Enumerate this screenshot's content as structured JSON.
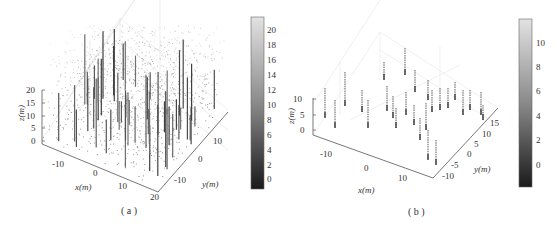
{
  "chart_data": [
    {
      "type": "scatter3d",
      "panel": "a",
      "caption": "( a )",
      "description": "3D point cloud of forest stand (dense canopy points + trunks), grayscale by height",
      "xlabel": "x(m)",
      "ylabel": "y(m)",
      "zlabel": "z(m)",
      "x_ticks": [
        "-10",
        "0",
        "10",
        "20"
      ],
      "y_ticks": [
        "-10",
        "0",
        "10"
      ],
      "z_ticks": [
        "0",
        "5",
        "10",
        "15",
        "20"
      ],
      "xlim": [
        -18,
        20
      ],
      "ylim": [
        -18,
        18
      ],
      "zlim": [
        -1,
        22
      ],
      "colorbar": {
        "ticks": [
          "20",
          "18",
          "16",
          "14",
          "12",
          "10",
          "8",
          "6",
          "4",
          "2",
          "0"
        ],
        "range": [
          -1.5,
          21.5
        ],
        "colormap": "gray"
      },
      "grid": true
    },
    {
      "type": "scatter3d",
      "panel": "b",
      "caption": "( b )",
      "description": "Extracted tree trunk points (vertical stems), grayscale by height",
      "xlabel": "x(m)",
      "ylabel": "y(m)",
      "zlabel": "z(m)",
      "x_ticks": [
        "-10",
        "0",
        "10"
      ],
      "y_ticks": [
        "-10",
        "-5",
        "0",
        "5",
        "10",
        "15"
      ],
      "z_ticks": [
        "0",
        "5",
        "10"
      ],
      "xlim": [
        -15,
        15
      ],
      "ylim": [
        -12,
        18
      ],
      "zlim": [
        -1,
        12
      ],
      "colorbar": {
        "ticks": [
          "10",
          "8",
          "6",
          "4",
          "2",
          "0"
        ],
        "range": [
          -1.5,
          11.8
        ],
        "colormap": "gray"
      },
      "grid": true
    }
  ],
  "labels": {
    "a": {
      "caption": "( a )",
      "xlabel": "x(m)",
      "ylabel": "y(m)",
      "zlabel": "z(m)",
      "x_ticks": [
        "-10",
        "0",
        "10",
        "20"
      ],
      "y_ticks": [
        "-10",
        "0",
        "10"
      ],
      "z_ticks": [
        "20",
        "15",
        "10",
        "5",
        "0"
      ],
      "cb_ticks": [
        "20",
        "18",
        "16",
        "14",
        "12",
        "10",
        "8",
        "6",
        "4",
        "2",
        "0"
      ]
    },
    "b": {
      "caption": "( b )",
      "xlabel": "x(m)",
      "ylabel": "y(m)",
      "zlabel": "z(m)",
      "x_ticks": [
        "-10",
        "0",
        "10"
      ],
      "y_ticks": [
        "15",
        "10",
        "5",
        "0",
        "-5",
        "-10"
      ],
      "z_ticks": [
        "10",
        "5",
        "0"
      ],
      "cb_ticks": [
        "10",
        "8",
        "6",
        "4",
        "2",
        "0"
      ]
    }
  }
}
